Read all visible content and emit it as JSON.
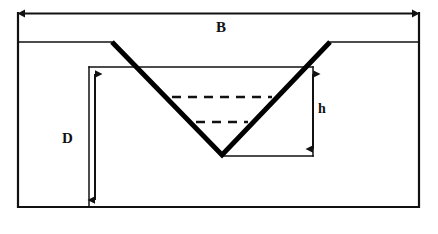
{
  "diagram": {
    "labels": {
      "top_width": "B",
      "depth": "D",
      "flow_depth": "h"
    },
    "colors": {
      "line": "#111111",
      "thick_line": "#000000",
      "background": "#ffffff",
      "dashed": "#111111"
    },
    "geometry": {
      "frame": {
        "left": 17,
        "right": 420,
        "top": 13,
        "bottom": 207
      },
      "ground_level_y": 42,
      "channel_top_left_x": 112,
      "channel_top_right_x": 330,
      "channel_vertex": {
        "x": 222,
        "y": 155
      },
      "inner_rect": {
        "left": 89,
        "top": 67,
        "right": 313,
        "bottom": 156
      },
      "dimension_B": {
        "y": 13,
        "x1": 20,
        "x2": 418
      },
      "dimension_D": {
        "x": 95,
        "y1": 67,
        "y2": 207
      },
      "dimension_h": {
        "x": 313,
        "y1": 67,
        "y2": 156
      },
      "water_line_upper": {
        "y": 97,
        "x1": 172,
        "x2": 272
      },
      "water_line_lower": {
        "y": 122,
        "x1": 196,
        "x2": 248
      }
    },
    "elements": {
      "outer_frame_name": "outer-frame",
      "ground_surface_name": "ground-surface-line",
      "channel_name": "trapezoidal-channel-outline",
      "water_surface_name": "water-surface-dashed-line"
    }
  }
}
